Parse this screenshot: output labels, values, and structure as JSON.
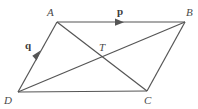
{
  "figure": {
    "type": "geometry-diagram",
    "shape": "parallelogram",
    "width": 198,
    "height": 109,
    "background_color": "#ffffff",
    "line_color": "#555555",
    "label_color": "#4a4a4a",
    "stroke_width": 1.1
  },
  "points": {
    "A": {
      "label": "A",
      "x": 57,
      "y": 22,
      "label_x": 47,
      "label_y": 8
    },
    "B": {
      "label": "B",
      "x": 185,
      "y": 22,
      "label_x": 187,
      "label_y": 8
    },
    "C": {
      "label": "C",
      "x": 147,
      "y": 91,
      "label_x": 144,
      "label_y": 95
    },
    "D": {
      "label": "D",
      "x": 18,
      "y": 92,
      "label_x": 4,
      "label_y": 95
    },
    "T": {
      "label": "T",
      "x": 100,
      "y": 58,
      "label_x": 99,
      "label_y": 42
    }
  },
  "edges": [
    {
      "name": "edge-AB",
      "from": "A",
      "to": "B"
    },
    {
      "name": "edge-BC",
      "from": "B",
      "to": "C"
    },
    {
      "name": "edge-CD",
      "from": "C",
      "to": "D"
    },
    {
      "name": "edge-DA",
      "from": "D",
      "to": "A"
    }
  ],
  "diagonals": [
    {
      "name": "diagonal-AC",
      "from": "A",
      "to": "C"
    },
    {
      "name": "diagonal-DB",
      "from": "D",
      "to": "B"
    }
  ],
  "vectors": [
    {
      "name": "vector-p",
      "label": "p",
      "on_edge": "AB",
      "label_x": 117,
      "label_y": 6,
      "arrow_x": 118,
      "arrow_y": 22,
      "direction": "right"
    },
    {
      "name": "vector-q",
      "label": "q",
      "on_edge": "DA",
      "label_x": 25,
      "label_y": 40,
      "arrow_x": 37,
      "arrow_y": 56,
      "direction": "up-right"
    }
  ]
}
